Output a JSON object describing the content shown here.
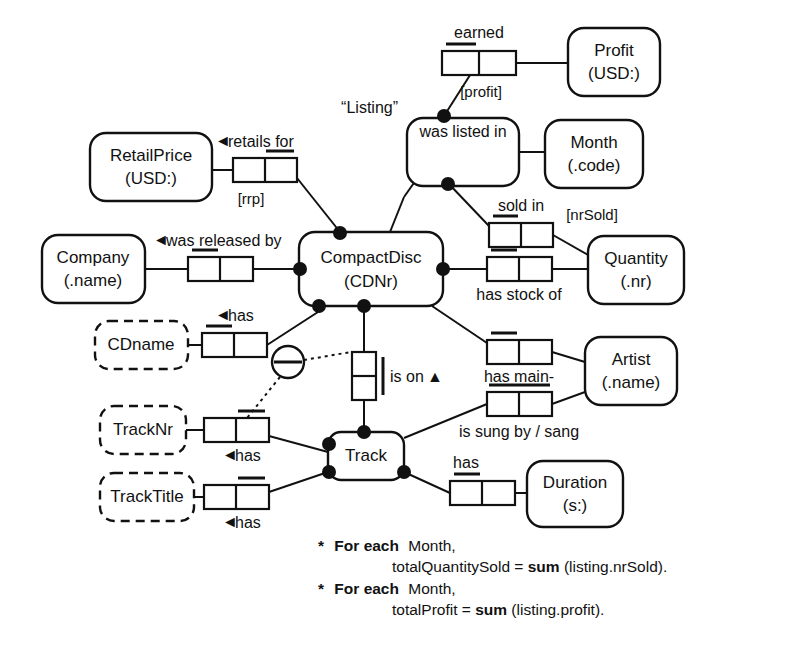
{
  "diagram": {
    "type": "ORM (Object-Role Modeling) schema diagram",
    "entities": [
      {
        "id": "profit",
        "label_line1": "Profit",
        "label_line2": "(USD:)",
        "kind": "entity"
      },
      {
        "id": "month",
        "label_line1": "Month",
        "label_line2": "(.code)",
        "kind": "entity"
      },
      {
        "id": "retailprice",
        "label_line1": "RetailPrice",
        "label_line2": "(USD:)",
        "kind": "entity"
      },
      {
        "id": "company",
        "label_line1": "Company",
        "label_line2": "(.name)",
        "kind": "entity"
      },
      {
        "id": "compactdisc",
        "label_line1": "CompactDisc",
        "label_line2": "(CDNr)",
        "kind": "entity"
      },
      {
        "id": "quantity",
        "label_line1": "Quantity",
        "label_line2": "(.nr)",
        "kind": "entity"
      },
      {
        "id": "artist",
        "label_line1": "Artist",
        "label_line2": "(.name)",
        "kind": "entity"
      },
      {
        "id": "duration",
        "label_line1": "Duration",
        "label_line2": "(s:)",
        "kind": "entity"
      },
      {
        "id": "track",
        "label_line1": "Track",
        "label_line2": "",
        "kind": "entity"
      },
      {
        "id": "cdname",
        "label_line1": "CDname",
        "label_line2": "",
        "kind": "value"
      },
      {
        "id": "tracknr",
        "label_line1": "TrackNr",
        "label_line2": "",
        "kind": "value"
      },
      {
        "id": "tracktitle",
        "label_line1": "TrackTitle",
        "label_line2": "",
        "kind": "value"
      }
    ],
    "objectified": {
      "id": "listing",
      "name": "“Listing”",
      "predicate": "was listed in"
    },
    "predicates": [
      {
        "id": "earned",
        "label": "earned",
        "reading_mark": ""
      },
      {
        "id": "was-listed-in",
        "label": "was listed in",
        "reading_mark": ""
      },
      {
        "id": "sold-in",
        "label": "sold in",
        "reading_mark": ""
      },
      {
        "id": "retails-for",
        "label": "retails for",
        "reading_mark": "◄"
      },
      {
        "id": "was-released-by",
        "label": "was released by",
        "reading_mark": "◄"
      },
      {
        "id": "has-stock-of",
        "label": "has stock of",
        "reading_mark": ""
      },
      {
        "id": "has-cdname",
        "label": "has",
        "reading_mark": "◄"
      },
      {
        "id": "is-on",
        "label": "is on",
        "reading_mark": "▲"
      },
      {
        "id": "has-main",
        "label": "has main-",
        "reading_mark": ""
      },
      {
        "id": "is-sung-by",
        "label": "is sung by / sang",
        "reading_mark": ""
      },
      {
        "id": "has-tracknr",
        "label": "has",
        "reading_mark": "◄"
      },
      {
        "id": "has-tracktitle",
        "label": "has",
        "reading_mark": "◄"
      },
      {
        "id": "has-duration",
        "label": "has",
        "reading_mark": ""
      }
    ],
    "role_names": [
      {
        "id": "profit-rolename",
        "label": "[profit]"
      },
      {
        "id": "rrp-rolename",
        "label": "[rrp]"
      },
      {
        "id": "nrsold-rolename",
        "label": "[nrSold]"
      }
    ],
    "constraints": [
      {
        "id": "external-uniqueness",
        "symbol": "circle-with-bar",
        "note": "external uniqueness constraint joining TrackNr-has role and is-on role"
      }
    ],
    "derivation_rules": [
      {
        "id": "rule-1",
        "marker": "*",
        "bold_prefix": "For each",
        "scope": "Month,",
        "body_pre": "totalQuantitySold = ",
        "body_fn": "sum",
        "body_post": "(listing.nrSold)."
      },
      {
        "id": "rule-2",
        "marker": "*",
        "bold_prefix": "For each",
        "scope": "Month,",
        "body_pre": "totalProfit = ",
        "body_fn": "sum",
        "body_post": "(listing.profit)."
      }
    ]
  },
  "colors": {
    "stroke": "#111111",
    "fill": "#ffffff",
    "background": "#ffffff"
  }
}
